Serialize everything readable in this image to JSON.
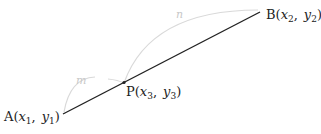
{
  "diagram": {
    "colors": {
      "segment": "#222222",
      "arc": "#d9d9d9",
      "arc_label": "#c8c8c8",
      "text": "#222222"
    },
    "points": {
      "A": {
        "name": "A",
        "x_var": "x",
        "x_sub": "1",
        "y_var": "y",
        "y_sub": "1"
      },
      "B": {
        "name": "B",
        "x_var": "x",
        "x_sub": "2",
        "y_var": "y",
        "y_sub": "2"
      },
      "P": {
        "name": "P",
        "x_var": "x",
        "x_sub": "3",
        "y_var": "y",
        "y_sub": "3"
      }
    },
    "arcs": {
      "AP": {
        "label": "m"
      },
      "PB": {
        "label": "n"
      }
    },
    "punct": {
      "open": "(",
      "comma": ",",
      "close": ")"
    }
  }
}
